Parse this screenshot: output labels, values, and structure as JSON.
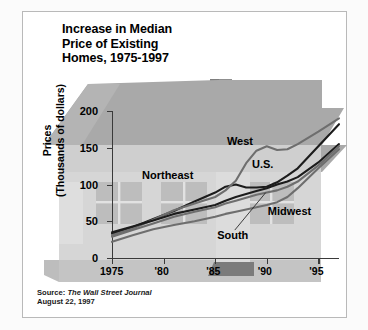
{
  "title": {
    "line1": "Increase in Median",
    "line2": "Price of Existing",
    "line3": "Homes, 1975-1997"
  },
  "source": {
    "prefix": "Source: ",
    "publication": "The Wall Street Journal",
    "date": "August 22, 1997"
  },
  "colors": {
    "dark_line": "#1c1c1c",
    "gray_line": "#6e6e6e",
    "roof": "#a9a9a9",
    "wall": "#c9c9c9",
    "body": "#d6d6d6",
    "window": "#bdbdbd",
    "door": "#7b7b7b",
    "chimney": "#8f8f8f",
    "axis": "#3a3a3a",
    "page": "#ffffff"
  },
  "chart_data": {
    "type": "line",
    "title": "Increase in Median Price of Existing Homes, 1975-1997",
    "xlabel": "",
    "ylabel": "Prices (Thousands of dollars)",
    "ylim": [
      0,
      200
    ],
    "xlim": [
      1975,
      1997
    ],
    "yticks": [
      0,
      50,
      100,
      150,
      200
    ],
    "xticks": [
      1975,
      1980,
      1985,
      1990,
      1995
    ],
    "xticklabels": [
      "1975",
      "'80",
      "'85",
      "'90",
      "'95"
    ],
    "yticklabels": [
      "0",
      "50",
      "100",
      "150",
      "200"
    ],
    "grid": false,
    "legend": "inline-annotations",
    "x": [
      1975,
      1977,
      1979,
      1981,
      1983,
      1985,
      1986,
      1987,
      1988,
      1989,
      1990,
      1991,
      1992,
      1993,
      1995,
      1997
    ],
    "series": [
      {
        "name": "Northeast",
        "color": "#1c1c1c",
        "label_x": 1980.4,
        "label_y": 112,
        "values": [
          33,
          42,
          53,
          64,
          77,
          89,
          97,
          100,
          96,
          96,
          97,
          103,
          112,
          122,
          152,
          182
        ]
      },
      {
        "name": "West",
        "color": "#6e6e6e",
        "label_x": 1987.4,
        "label_y": 158,
        "values": [
          31,
          40,
          52,
          65,
          74,
          83,
          92,
          105,
          129,
          146,
          152,
          147,
          148,
          155,
          172,
          190
        ]
      },
      {
        "name": "U.S.",
        "color": "#1c1c1c",
        "label_x": 1989.6,
        "label_y": 127,
        "values": [
          35,
          43,
          51,
          60,
          66,
          72,
          78,
          83,
          87,
          91,
          95,
          100,
          104,
          110,
          130,
          155
        ]
      },
      {
        "name": "South",
        "color": "#6e6e6e",
        "label_x": 1986.7,
        "label_y": 30,
        "values": [
          29,
          38,
          47,
          56,
          63,
          69,
          74,
          78,
          82,
          86,
          89,
          92,
          97,
          104,
          126,
          152
        ]
      },
      {
        "name": "Midwest",
        "color": "#6e6e6e",
        "label_x": 1992.2,
        "label_y": 62,
        "values": [
          22,
          31,
          39,
          45,
          50,
          56,
          60,
          63,
          66,
          69,
          72,
          76,
          83,
          95,
          122,
          148
        ]
      }
    ],
    "annotations": [
      {
        "name": "south-leader-line",
        "from_x": 1986.9,
        "from_y": 38,
        "to_x": 1989.9,
        "to_y": 89
      }
    ]
  }
}
